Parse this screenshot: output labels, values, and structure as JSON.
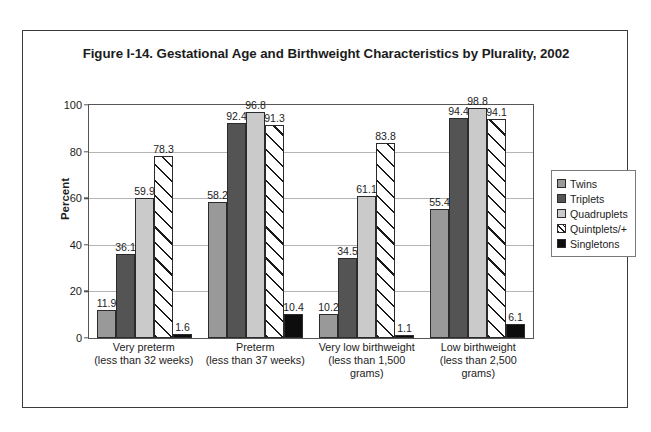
{
  "figure": {
    "title": "Figure I-14. Gestational Age and Birthweight Characteristics by Plurality, 2002"
  },
  "chart_data": {
    "type": "bar",
    "title": "Figure I-14. Gestational Age and Birthweight Characteristics by Plurality, 2002",
    "xlabel": "",
    "ylabel": "Percent",
    "ylim": [
      0,
      100
    ],
    "yticks": [
      0,
      20,
      40,
      60,
      80,
      100
    ],
    "grid": true,
    "legend_position": "right",
    "categories": [
      "Very preterm\n(less than 32 weeks)",
      "Preterm\n(less than 37 weeks)",
      "Very low birthweight\n(less than 1,500 grams)",
      "Low birthweight\n(less than 2,500 grams)"
    ],
    "category_lines": [
      [
        "Very preterm",
        "(less than 32 weeks)"
      ],
      [
        "Preterm",
        "(less than 37 weeks)"
      ],
      [
        "Very low birthweight",
        "(less than 1,500",
        "grams)"
      ],
      [
        "Low birthweight",
        "(less than 2,500",
        "grams)"
      ]
    ],
    "series": [
      {
        "name": "Twins",
        "color": "#999999",
        "values": [
          11.9,
          58.2,
          10.2,
          55.4
        ]
      },
      {
        "name": "Triplets",
        "color": "#545454",
        "values": [
          36.1,
          92.4,
          34.5,
          94.4
        ]
      },
      {
        "name": "Quadruplets",
        "color": "#cacaca",
        "values": [
          59.9,
          96.8,
          61.1,
          98.8
        ]
      },
      {
        "name": "Quintplets/+",
        "color": "#ffffff",
        "values": [
          78.3,
          91.3,
          83.8,
          94.1
        ]
      },
      {
        "name": "Singletons",
        "color": "#0d0d0d",
        "values": [
          1.6,
          10.4,
          1.1,
          6.1
        ]
      }
    ]
  },
  "legend": {
    "items": [
      {
        "label": "Twins"
      },
      {
        "label": "Triplets"
      },
      {
        "label": "Quadruplets"
      },
      {
        "label": "Quintplets/+"
      },
      {
        "label": "Singletons"
      }
    ]
  }
}
